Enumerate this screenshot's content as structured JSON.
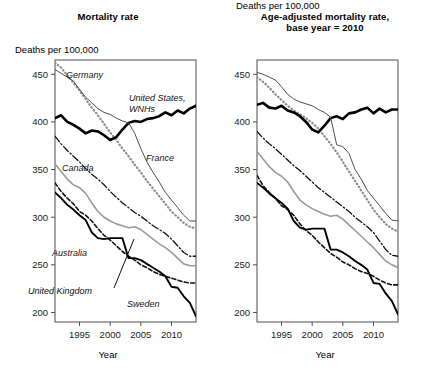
{
  "figure": {
    "panels": [
      {
        "id": "mortality-rate",
        "title": "Mortality rate",
        "y_unit_label": "Deaths per 100,000",
        "x_axis_title": "Year"
      },
      {
        "id": "age-adjusted-mortality-rate",
        "title_line1": "Age-adjusted mortality rate,",
        "title_line2": "base year = 2010",
        "y_unit_label": "Deaths per 100,000",
        "x_axis_title": "Year"
      }
    ],
    "series_labels": {
      "germany": "Germany",
      "united_states": "United States,",
      "united_states_line2": "WNHs",
      "france": "France",
      "canada": "Canada",
      "australia": "Australia",
      "united_kingdom": "United Kingdom",
      "sweden": "Sweden"
    },
    "y_ticks": [
      "200",
      "250",
      "300",
      "350",
      "400",
      "450"
    ],
    "x_ticks": [
      "1995",
      "2000",
      "2005",
      "2010"
    ]
  },
  "chart_data": [
    {
      "type": "line",
      "title": "Mortality rate",
      "xlabel": "Year",
      "ylabel": "Deaths per 100,000",
      "xlim": [
        1991,
        2014
      ],
      "ylim": [
        190,
        465
      ],
      "yticks": [
        200,
        250,
        300,
        350,
        400,
        450
      ],
      "xticks": [
        1995,
        2000,
        2005,
        2010
      ],
      "grid": false,
      "legend": "inline-annotations",
      "x": [
        1991,
        1992,
        1993,
        1994,
        1995,
        1996,
        1997,
        1998,
        1999,
        2000,
        2001,
        2002,
        2003,
        2004,
        2005,
        2006,
        2007,
        2008,
        2009,
        2010,
        2011,
        2012,
        2013,
        2014
      ],
      "series": [
        {
          "name": "Germany",
          "style": "dotted",
          "color": "#8c8c8c",
          "width": 2.2,
          "values": [
            462,
            457,
            449,
            441,
            433,
            424,
            415,
            407,
            398,
            389,
            381,
            372,
            364,
            355,
            347,
            338,
            330,
            322,
            314,
            306,
            300,
            294,
            290,
            288
          ]
        },
        {
          "name": "United States, WNHs",
          "style": "solid",
          "color": "#000000",
          "width": 2.6,
          "values": [
            404,
            407,
            400,
            397,
            393,
            388,
            391,
            390,
            386,
            381,
            384,
            392,
            399,
            401,
            400,
            403,
            404,
            406,
            410,
            407,
            412,
            409,
            414,
            417
          ]
        },
        {
          "name": "France",
          "style": "solid",
          "color": "#4d4d4d",
          "width": 1.0,
          "values": [
            455,
            451,
            447,
            443,
            434,
            426,
            420,
            414,
            410,
            408,
            404,
            401,
            399,
            388,
            372,
            358,
            347,
            337,
            326,
            318,
            310,
            302,
            296,
            296
          ]
        },
        {
          "name": "Canada",
          "style": "dashdot",
          "color": "#111111",
          "width": 1.3,
          "values": [
            385,
            377,
            370,
            364,
            358,
            351,
            345,
            340,
            334,
            327,
            321,
            315,
            310,
            305,
            301,
            296,
            291,
            287,
            283,
            277,
            270,
            263,
            259,
            259
          ]
        },
        {
          "name": "Australia",
          "style": "solid",
          "color": "#9a9a9a",
          "width": 1.6,
          "values": [
            356,
            348,
            340,
            334,
            331,
            325,
            315,
            306,
            300,
            296,
            293,
            291,
            289,
            290,
            287,
            282,
            277,
            272,
            268,
            263,
            257,
            251,
            249,
            249
          ]
        },
        {
          "name": "United Kingdom",
          "style": "dashed",
          "color": "#111111",
          "width": 1.6,
          "values": [
            336,
            327,
            320,
            314,
            306,
            302,
            296,
            288,
            281,
            276,
            270,
            264,
            259,
            255,
            250,
            247,
            243,
            240,
            238,
            236,
            234,
            232,
            231,
            231
          ]
        },
        {
          "name": "Sweden",
          "style": "solid",
          "color": "#000000",
          "width": 1.9,
          "values": [
            326,
            320,
            313,
            308,
            302,
            297,
            284,
            278,
            277,
            278,
            278,
            278,
            257,
            257,
            255,
            251,
            247,
            243,
            238,
            227,
            226,
            217,
            210,
            196
          ]
        }
      ]
    },
    {
      "type": "line",
      "title": "Age-adjusted mortality rate, base year = 2010",
      "xlabel": "Year",
      "ylabel": "Deaths per 100,000",
      "xlim": [
        1991,
        2014
      ],
      "ylim": [
        190,
        465
      ],
      "yticks": [
        200,
        250,
        300,
        350,
        400,
        450
      ],
      "xticks": [
        1995,
        2000,
        2005,
        2010
      ],
      "grid": false,
      "legend": "inline-annotations",
      "x": [
        1991,
        1992,
        1993,
        1994,
        1995,
        1996,
        1997,
        1998,
        1999,
        2000,
        2001,
        2002,
        2003,
        2004,
        2005,
        2006,
        2007,
        2008,
        2009,
        2010,
        2011,
        2012,
        2013,
        2014
      ],
      "series": [
        {
          "name": "Germany",
          "style": "dotted",
          "color": "#8c8c8c",
          "width": 2.2,
          "values": [
            447,
            442,
            436,
            429,
            423,
            417,
            412,
            408,
            404,
            399,
            393,
            385,
            377,
            368,
            358,
            348,
            338,
            328,
            318,
            308,
            300,
            293,
            288,
            285
          ]
        },
        {
          "name": "United States, WNHs",
          "style": "solid",
          "color": "#000000",
          "width": 2.6,
          "values": [
            418,
            420,
            415,
            414,
            417,
            412,
            410,
            406,
            400,
            392,
            389,
            396,
            404,
            406,
            403,
            409,
            410,
            413,
            415,
            409,
            414,
            410,
            413,
            413
          ]
        },
        {
          "name": "France",
          "style": "solid",
          "color": "#4d4d4d",
          "width": 1.0,
          "values": [
            452,
            450,
            447,
            444,
            437,
            429,
            424,
            421,
            419,
            417,
            413,
            410,
            405,
            376,
            374,
            367,
            350,
            340,
            328,
            320,
            312,
            304,
            297,
            296
          ]
        },
        {
          "name": "Canada",
          "style": "dashdot",
          "color": "#111111",
          "width": 1.3,
          "values": [
            390,
            383,
            377,
            372,
            366,
            360,
            354,
            349,
            343,
            337,
            331,
            326,
            321,
            316,
            311,
            306,
            300,
            295,
            290,
            284,
            275,
            266,
            260,
            259
          ]
        },
        {
          "name": "Australia",
          "style": "solid",
          "color": "#9a9a9a",
          "width": 1.6,
          "values": [
            369,
            361,
            353,
            347,
            343,
            337,
            327,
            318,
            313,
            309,
            306,
            303,
            301,
            302,
            298,
            292,
            286,
            280,
            274,
            268,
            261,
            254,
            250,
            247
          ]
        },
        {
          "name": "United Kingdom",
          "style": "dashed",
          "color": "#111111",
          "width": 1.6,
          "values": [
            344,
            333,
            326,
            320,
            312,
            308,
            302,
            293,
            286,
            281,
            274,
            268,
            262,
            258,
            253,
            250,
            246,
            243,
            241,
            238,
            234,
            231,
            229,
            229
          ]
        },
        {
          "name": "Sweden",
          "style": "solid",
          "color": "#000000",
          "width": 1.9,
          "values": [
            336,
            331,
            325,
            320,
            315,
            309,
            296,
            289,
            287,
            288,
            288,
            288,
            266,
            266,
            263,
            259,
            254,
            250,
            245,
            231,
            230,
            220,
            212,
            198
          ]
        }
      ]
    }
  ]
}
